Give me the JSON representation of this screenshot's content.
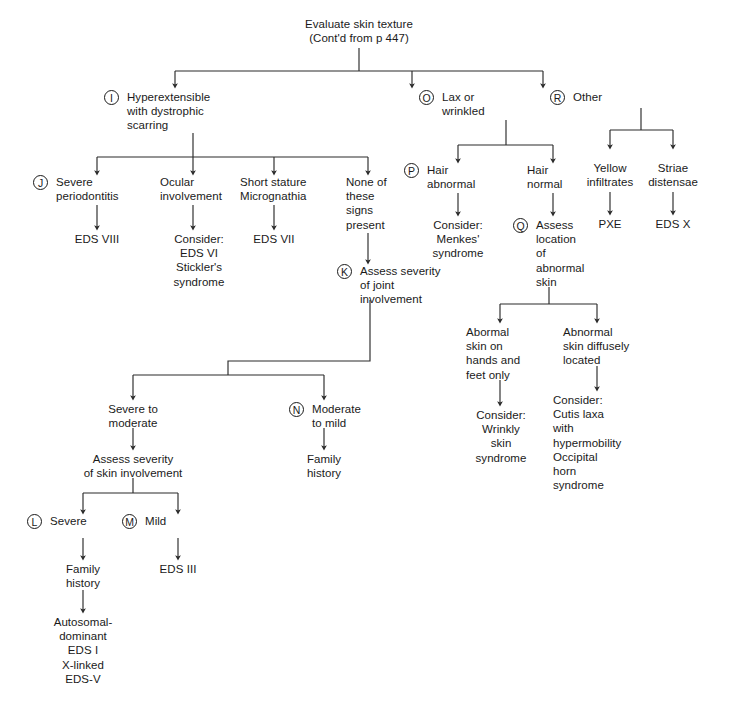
{
  "diagram": {
    "title": "Evaluate skin texture",
    "subtitle": "(Cont'd from p 447)",
    "nodes": {
      "root": "Evaluate skin texture\n(Cont'd from p 447)",
      "i_label": "Hyperextensible\nwith dystrophic\nscarring",
      "o_label": "Lax or\nwrinkled",
      "r_label": "Other",
      "j_label": "Severe\nperiodontitis",
      "j_result": "EDS VIII",
      "ocular": "Ocular\ninvolvement",
      "ocular_result": "Consider:\nEDS VI\nStickler's\nsyndrome",
      "short_stature": "Short stature\nMicrognathia",
      "short_result": "EDS VII",
      "none_signs": "None of\nthese\nsigns\npresent",
      "k_label": "Assess severity\nof joint\ninvolvement",
      "severe_moderate": "Severe to\nmoderate",
      "assess_skin": "Assess severity\nof skin involvement",
      "n_label": "Moderate\nto mild",
      "n_result": "Family\nhistory",
      "l_label": "Severe",
      "l_result": "Family\nhistory",
      "l_final": "Autosomal-\ndominant\nEDS I\nX-linked\nEDS-V",
      "m_label": "Mild",
      "m_result": "EDS III",
      "p_label": "Hair\nabnormal",
      "p_result": "Consider:\nMenkes'\nsyndrome",
      "hair_normal": "Hair\nnormal",
      "q_label": "Assess\nlocation\nof\nabnormal\nskin",
      "q_hands": "Abormal\nskin on\nhands and\nfeet only",
      "q_hands_result": "Consider:\nWrinkly\nskin\nsyndrome",
      "q_diffuse": "Abnormal\nskin diffusely\nlocated",
      "q_diffuse_result": "Consider:\nCutis laxa\nwith\nhypermobility\nOccipital\nhorn\nsyndrome",
      "yellow_infiltrates": "Yellow\ninfiltrates",
      "pxe_result": "PXE",
      "striae": "Striae\ndistensae",
      "edsx_result": "EDS X"
    },
    "badges": {
      "i": "I",
      "j": "J",
      "k": "K",
      "l": "L",
      "m": "M",
      "n": "N",
      "o": "O",
      "p": "P",
      "q": "Q",
      "r": "R"
    },
    "colors": {
      "line": "#2b2b2b",
      "text": "#1a1a1a",
      "background": "#ffffff"
    }
  }
}
